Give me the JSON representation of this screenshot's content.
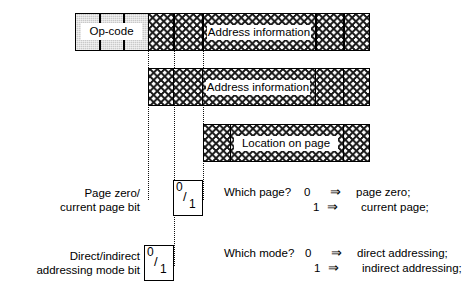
{
  "diagram": {
    "rows": [
      {
        "id": "row-1",
        "opcode_label": "Op-code",
        "address_label": "Address information"
      },
      {
        "id": "row-2",
        "address_label": "Address information"
      },
      {
        "id": "row-3",
        "address_label": "Location on  page"
      }
    ],
    "bits": [
      {
        "id": "page-zero-bit",
        "label_line1": "Page zero/",
        "label_line2": "current page bit",
        "zero": "0",
        "slash": "/",
        "one": "1",
        "question": "Which page?",
        "digit_0": "0",
        "digit_1": "1",
        "arrow": "⇒",
        "result_0": "page zero;",
        "result_1": "current page;"
      },
      {
        "id": "addressing-mode-bit",
        "label_line1": "Direct/indirect",
        "label_line2": "addressing mode bit",
        "zero": "0",
        "slash": "/",
        "one": "1",
        "question": "Which mode?",
        "digit_0": "0",
        "digit_1": "1",
        "arrow": "⇒",
        "result_0": "direct addressing;",
        "result_1": "indirect addressing;"
      }
    ],
    "colors": {
      "opcode_fill": "#c9c9c9",
      "stroke": "#000000",
      "background": "#ffffff"
    }
  }
}
